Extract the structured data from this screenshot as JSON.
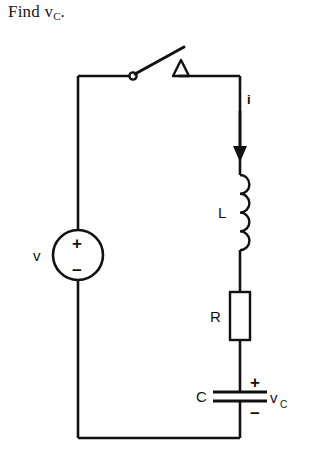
{
  "problem": {
    "prompt_prefix": "Find v",
    "prompt_subscript": "C",
    "prompt_suffix": "."
  },
  "circuit": {
    "type": "series-RLC",
    "source": {
      "label": "v",
      "plus_sign": "+",
      "minus_sign": "−",
      "shape": "circle"
    },
    "switch": {
      "state": "open",
      "terminal_marker": "triangle"
    },
    "current": {
      "label": "i",
      "direction": "down"
    },
    "inductor": {
      "label": "L",
      "coil_count": 4
    },
    "resistor": {
      "label": "R",
      "shape": "rectangle"
    },
    "capacitor": {
      "label": "C",
      "plus_sign": "+",
      "minus_sign": "−",
      "voltage_label": "v",
      "voltage_subscript": "C"
    },
    "colors": {
      "ink": "#111111",
      "background": "#ffffff"
    }
  }
}
